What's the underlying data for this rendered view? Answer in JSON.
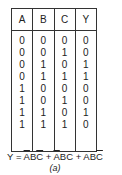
{
  "truth_table": {
    "headers": [
      "A",
      "B",
      "C",
      "Y"
    ],
    "columns": {
      "A": [
        "0",
        "0",
        "0",
        "0",
        "1",
        "1",
        "1",
        "1"
      ],
      "B": [
        "0",
        "0",
        "1",
        "1",
        "0",
        "0",
        "1",
        "1"
      ],
      "C": [
        "0",
        "1",
        "0",
        "1",
        "0",
        "1",
        "0",
        "1"
      ],
      "Y": [
        "0",
        "0",
        "1",
        "1",
        "0",
        "0",
        "1",
        "0"
      ]
    }
  },
  "formula": {
    "lhs": "Y = ",
    "t1_a": "A",
    "t1_b": "B",
    "t1_c": "C",
    "plus1": " + ",
    "t2_a": "A",
    "t2_bc": "BC",
    "plus2": " + ",
    "t3_ab": "AB",
    "t3_c": "C"
  },
  "caption": "(a)"
}
